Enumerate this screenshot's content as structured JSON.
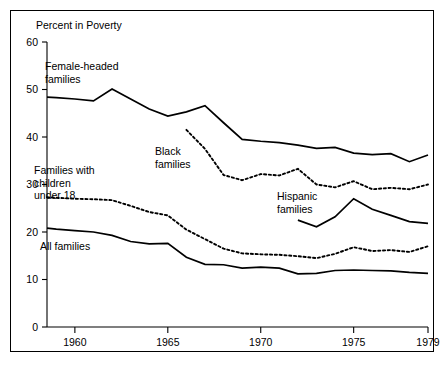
{
  "chart_data": {
    "type": "line",
    "title": "Percent in Poverty",
    "xlabel": "",
    "ylabel": "Percent in Poverty",
    "xlim": [
      1958.5,
      1979
    ],
    "ylim": [
      0,
      60
    ],
    "grid": false,
    "legend": "inline-annotations",
    "yticks": [
      0,
      10,
      20,
      30,
      40,
      50,
      60
    ],
    "ytick_labels": [
      "0",
      "10",
      "20",
      "30",
      "40",
      "50",
      "60"
    ],
    "xticks": [
      1960,
      1965,
      1970,
      1975,
      1979
    ],
    "xtick_labels": [
      "1960",
      "1965",
      "1970",
      "1975",
      "1979"
    ],
    "series": [
      {
        "name": "Female-headed families",
        "style": "solid",
        "x": [
          1958.5,
          1959,
          1960,
          1961,
          1962,
          1963,
          1964,
          1965,
          1966,
          1967,
          1968,
          1969,
          1970,
          1971,
          1972,
          1973,
          1974,
          1975,
          1976,
          1977,
          1978,
          1979
        ],
        "values": [
          48.4,
          48.3,
          48.0,
          47.6,
          50.1,
          48.0,
          45.9,
          44.4,
          45.3,
          46.6,
          43.0,
          39.5,
          39.1,
          38.8,
          38.3,
          37.6,
          37.8,
          36.6,
          36.3,
          36.5,
          34.8,
          36.2
        ]
      },
      {
        "name": "Black families",
        "style": "dotted",
        "x": [
          1966,
          1967,
          1968,
          1969,
          1970,
          1971,
          1972,
          1973,
          1974,
          1975,
          1976,
          1977,
          1978,
          1979
        ],
        "values": [
          41.5,
          37.5,
          32.0,
          30.9,
          32.2,
          31.9,
          33.3,
          30.0,
          29.4,
          30.7,
          29.0,
          29.3,
          29.0,
          30.0
        ]
      },
      {
        "name": "Families with children under 18",
        "style": "dotted",
        "x": [
          1958.5,
          1959,
          1960,
          1961,
          1962,
          1963,
          1964,
          1965,
          1966,
          1967,
          1968,
          1969,
          1970,
          1971,
          1972,
          1973,
          1974,
          1975,
          1976,
          1977,
          1978,
          1979
        ],
        "values": [
          27.3,
          27.2,
          27.0,
          26.9,
          26.7,
          25.5,
          24.2,
          23.5,
          20.5,
          18.5,
          16.5,
          15.5,
          15.3,
          15.2,
          14.9,
          14.5,
          15.4,
          16.8,
          16.0,
          16.2,
          15.8,
          17.0
        ]
      },
      {
        "name": "All families",
        "style": "solid",
        "x": [
          1958.5,
          1959,
          1960,
          1961,
          1962,
          1963,
          1964,
          1965,
          1966,
          1967,
          1968,
          1969,
          1970,
          1971,
          1972,
          1973,
          1974,
          1975,
          1976,
          1977,
          1978,
          1979
        ],
        "values": [
          20.8,
          20.6,
          20.3,
          20.0,
          19.3,
          18.0,
          17.5,
          17.6,
          14.7,
          13.2,
          13.1,
          12.4,
          12.6,
          12.4,
          11.2,
          11.3,
          11.9,
          12.0,
          11.9,
          11.8,
          11.5,
          11.3
        ]
      },
      {
        "name": "Hispanic families",
        "style": "solid",
        "x": [
          1972,
          1973,
          1974,
          1975,
          1976,
          1977,
          1978,
          1979
        ],
        "values": [
          22.5,
          21.1,
          23.2,
          27.0,
          24.8,
          23.5,
          22.2,
          21.8
        ]
      }
    ],
    "annotations": [
      {
        "text_line1": "Female-headed",
        "text_line2": "families",
        "x_px": 45,
        "y_px": 70
      },
      {
        "text_line1": "Black",
        "text_line2": "families",
        "x_px": 155,
        "y_px": 155
      },
      {
        "text_line1": "Families with",
        "text_line2": "children",
        "text_line3": "under 18",
        "x_px": 34,
        "y_px": 174
      },
      {
        "text_line1": "All families",
        "text_line2": "",
        "x_px": 40,
        "y_px": 250
      },
      {
        "text_line1": "Hispanic",
        "text_line2": "families",
        "x_px": 277,
        "y_px": 200
      }
    ]
  },
  "figure": {
    "axis_title": "Percent in Poverty",
    "frame_color": "#000000",
    "background": "#ffffff",
    "line_color": "#000000"
  }
}
